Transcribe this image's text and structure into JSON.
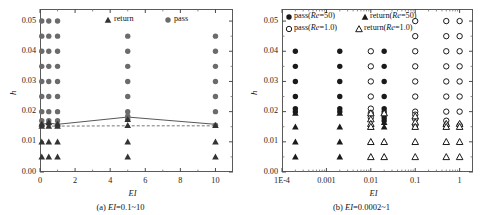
{
  "figure": {
    "panels": [
      {
        "id": "a",
        "caption_prefix": "(a) ",
        "caption_var": "EI",
        "caption_rest": "=0.1~10",
        "caption_full": "(a) EI=0.1~10",
        "xlabel": "EI",
        "ylabel": "h",
        "legend": [
          {
            "label": "return",
            "marker": "filled-triangle"
          },
          {
            "label": "pass",
            "marker": "filled-circle"
          }
        ]
      },
      {
        "id": "b",
        "caption_prefix": "(b) ",
        "caption_var": "EI",
        "caption_rest": "=0.0002~1",
        "caption_full": "(b) EI=0.0002~1",
        "xlabel": "EI",
        "ylabel": "h",
        "legend": [
          {
            "label_pre": "pass(",
            "label_var": "Re",
            "label_post": "=50)",
            "marker": "filled-circle"
          },
          {
            "label_pre": "return(",
            "label_var": "Re",
            "label_post": "=50)",
            "marker": "filled-triangle"
          },
          {
            "label_pre": "pass(",
            "label_var": "Re",
            "label_post": "=1.0)",
            "marker": "open-circle"
          },
          {
            "label_pre": "return(",
            "label_var": "Re",
            "label_post": "=1.0)",
            "marker": "open-triangle"
          }
        ]
      }
    ]
  },
  "chart_data": [
    {
      "type": "scatter",
      "panel": "a",
      "title": "(a) EI=0.1~10",
      "xlabel": "EI",
      "ylabel": "h",
      "xscale": "linear",
      "xlim": [
        0,
        11
      ],
      "ylim": [
        0.0,
        0.054
      ],
      "xticks": [
        "0",
        "2",
        "4",
        "6",
        "8",
        "10"
      ],
      "xtick_values": [
        0,
        2,
        4,
        6,
        8,
        10
      ],
      "yticks": [
        "0.00",
        "0.01",
        "0.02",
        "0.03",
        "0.04",
        "0.05"
      ],
      "ytick_values": [
        0.0,
        0.01,
        0.02,
        0.03,
        0.04,
        0.05
      ],
      "minor_ticks": true,
      "grid": false,
      "legend_position": "top-center",
      "series": [
        {
          "name": "pass",
          "marker": "filled-circle",
          "color": "#6b6b6b",
          "points": [
            {
              "x": 0.1,
              "y": 0.05
            },
            {
              "x": 0.5,
              "y": 0.05
            },
            {
              "x": 1.0,
              "y": 0.05
            },
            {
              "x": 0.1,
              "y": 0.045
            },
            {
              "x": 0.5,
              "y": 0.045
            },
            {
              "x": 1.0,
              "y": 0.045
            },
            {
              "x": 0.1,
              "y": 0.04
            },
            {
              "x": 0.5,
              "y": 0.04
            },
            {
              "x": 1.0,
              "y": 0.04
            },
            {
              "x": 0.1,
              "y": 0.035
            },
            {
              "x": 0.5,
              "y": 0.035
            },
            {
              "x": 1.0,
              "y": 0.035
            },
            {
              "x": 0.1,
              "y": 0.03
            },
            {
              "x": 0.5,
              "y": 0.03
            },
            {
              "x": 1.0,
              "y": 0.03
            },
            {
              "x": 0.1,
              "y": 0.025
            },
            {
              "x": 0.5,
              "y": 0.025
            },
            {
              "x": 1.0,
              "y": 0.025
            },
            {
              "x": 0.1,
              "y": 0.02
            },
            {
              "x": 0.5,
              "y": 0.02
            },
            {
              "x": 1.0,
              "y": 0.02
            },
            {
              "x": 0.1,
              "y": 0.017
            },
            {
              "x": 0.5,
              "y": 0.017
            },
            {
              "x": 1.0,
              "y": 0.017
            },
            {
              "x": 0.1,
              "y": 0.0155
            },
            {
              "x": 0.5,
              "y": 0.016
            },
            {
              "x": 1.0,
              "y": 0.0155
            },
            {
              "x": 5.0,
              "y": 0.045
            },
            {
              "x": 5.0,
              "y": 0.04
            },
            {
              "x": 5.0,
              "y": 0.035
            },
            {
              "x": 5.0,
              "y": 0.03
            },
            {
              "x": 5.0,
              "y": 0.025
            },
            {
              "x": 5.0,
              "y": 0.02
            },
            {
              "x": 5.0,
              "y": 0.0185
            },
            {
              "x": 5.0,
              "y": 0.0175
            },
            {
              "x": 10.0,
              "y": 0.045
            },
            {
              "x": 10.0,
              "y": 0.04
            },
            {
              "x": 10.0,
              "y": 0.035
            },
            {
              "x": 10.0,
              "y": 0.03
            },
            {
              "x": 10.0,
              "y": 0.025
            },
            {
              "x": 10.0,
              "y": 0.02
            },
            {
              "x": 10.0,
              "y": 0.0155
            }
          ]
        },
        {
          "name": "return",
          "marker": "filled-triangle",
          "color": "#333333",
          "points": [
            {
              "x": 0.1,
              "y": 0.016
            },
            {
              "x": 0.5,
              "y": 0.0165
            },
            {
              "x": 1.0,
              "y": 0.016
            },
            {
              "x": 0.1,
              "y": 0.0152
            },
            {
              "x": 0.5,
              "y": 0.0152
            },
            {
              "x": 1.0,
              "y": 0.0152
            },
            {
              "x": 0.1,
              "y": 0.01
            },
            {
              "x": 0.5,
              "y": 0.01
            },
            {
              "x": 1.0,
              "y": 0.01
            },
            {
              "x": 0.1,
              "y": 0.005
            },
            {
              "x": 0.5,
              "y": 0.005
            },
            {
              "x": 1.0,
              "y": 0.005
            },
            {
              "x": 5.0,
              "y": 0.0175
            },
            {
              "x": 5.0,
              "y": 0.0155
            },
            {
              "x": 5.0,
              "y": 0.01
            },
            {
              "x": 5.0,
              "y": 0.005
            },
            {
              "x": 10.0,
              "y": 0.0155
            },
            {
              "x": 10.0,
              "y": 0.01
            },
            {
              "x": 10.0,
              "y": 0.005
            }
          ]
        }
      ],
      "lines": [
        {
          "name": "solid-boundary",
          "style": "solid",
          "color": "#444444",
          "points": [
            {
              "x": 0.1,
              "y": 0.0158
            },
            {
              "x": 0.5,
              "y": 0.0162
            },
            {
              "x": 1.0,
              "y": 0.0158
            },
            {
              "x": 5.0,
              "y": 0.0182
            },
            {
              "x": 10.0,
              "y": 0.0158
            }
          ]
        },
        {
          "name": "dashed-boundary",
          "style": "dashed",
          "color": "#666666",
          "points": [
            {
              "x": 0.1,
              "y": 0.0152
            },
            {
              "x": 1.0,
              "y": 0.0152
            },
            {
              "x": 5.0,
              "y": 0.0153
            },
            {
              "x": 10.0,
              "y": 0.0153
            }
          ]
        }
      ]
    },
    {
      "type": "scatter",
      "panel": "b",
      "title": "(b) EI=0.0002~1",
      "xlabel": "EI",
      "ylabel": "h",
      "xscale": "log",
      "xlim": [
        0.0001,
        2.0
      ],
      "ylim": [
        0.0,
        0.054
      ],
      "xticks": [
        "1E-4",
        "0.001",
        "0.01",
        "0.1",
        "1"
      ],
      "xtick_values": [
        0.0001,
        0.001,
        0.01,
        0.1,
        1
      ],
      "yticks": [
        "0.00",
        "0.01",
        "0.02",
        "0.03",
        "0.04",
        "0.05"
      ],
      "ytick_values": [
        0.0,
        0.01,
        0.02,
        0.03,
        0.04,
        0.05
      ],
      "minor_ticks": true,
      "grid": false,
      "legend_position": "top-left",
      "series": [
        {
          "name": "pass(Re=50)",
          "marker": "filled-circle",
          "color": "#1a1a1a",
          "points": [
            {
              "x": 0.0002,
              "y": 0.04
            },
            {
              "x": 0.0002,
              "y": 0.035
            },
            {
              "x": 0.0002,
              "y": 0.03
            },
            {
              "x": 0.0002,
              "y": 0.025
            },
            {
              "x": 0.0002,
              "y": 0.021
            },
            {
              "x": 0.0002,
              "y": 0.02
            },
            {
              "x": 0.002,
              "y": 0.04
            },
            {
              "x": 0.002,
              "y": 0.035
            },
            {
              "x": 0.002,
              "y": 0.03
            },
            {
              "x": 0.002,
              "y": 0.025
            },
            {
              "x": 0.002,
              "y": 0.021
            },
            {
              "x": 0.002,
              "y": 0.02
            },
            {
              "x": 0.02,
              "y": 0.04
            },
            {
              "x": 0.02,
              "y": 0.035
            },
            {
              "x": 0.02,
              "y": 0.03
            },
            {
              "x": 0.02,
              "y": 0.025
            },
            {
              "x": 0.02,
              "y": 0.021
            },
            {
              "x": 0.02,
              "y": 0.02
            },
            {
              "x": 0.02,
              "y": 0.019
            },
            {
              "x": 0.02,
              "y": 0.018
            },
            {
              "x": 0.02,
              "y": 0.017
            }
          ]
        },
        {
          "name": "return(Re=50)",
          "marker": "filled-triangle",
          "color": "#1a1a1a",
          "points": [
            {
              "x": 0.0002,
              "y": 0.0195
            },
            {
              "x": 0.0002,
              "y": 0.015
            },
            {
              "x": 0.0002,
              "y": 0.01
            },
            {
              "x": 0.0002,
              "y": 0.005
            },
            {
              "x": 0.002,
              "y": 0.0195
            },
            {
              "x": 0.002,
              "y": 0.015
            },
            {
              "x": 0.002,
              "y": 0.01
            },
            {
              "x": 0.002,
              "y": 0.005
            },
            {
              "x": 0.02,
              "y": 0.0165
            },
            {
              "x": 0.02,
              "y": 0.015
            },
            {
              "x": 0.02,
              "y": 0.01
            },
            {
              "x": 0.02,
              "y": 0.005
            },
            {
              "x": 0.01,
              "y": 0.015
            },
            {
              "x": 0.01,
              "y": 0.01
            },
            {
              "x": 0.01,
              "y": 0.005
            }
          ]
        },
        {
          "name": "pass(Re=1.0)",
          "marker": "open-circle",
          "color": "#1a1a1a",
          "points": [
            {
              "x": 0.01,
              "y": 0.04
            },
            {
              "x": 0.01,
              "y": 0.035
            },
            {
              "x": 0.01,
              "y": 0.03
            },
            {
              "x": 0.01,
              "y": 0.025
            },
            {
              "x": 0.01,
              "y": 0.021
            },
            {
              "x": 0.01,
              "y": 0.0195
            },
            {
              "x": 0.01,
              "y": 0.018
            },
            {
              "x": 0.1,
              "y": 0.05
            },
            {
              "x": 0.1,
              "y": 0.045
            },
            {
              "x": 0.1,
              "y": 0.04
            },
            {
              "x": 0.1,
              "y": 0.035
            },
            {
              "x": 0.1,
              "y": 0.03
            },
            {
              "x": 0.1,
              "y": 0.025
            },
            {
              "x": 0.1,
              "y": 0.02
            },
            {
              "x": 0.1,
              "y": 0.019
            },
            {
              "x": 0.1,
              "y": 0.0175
            },
            {
              "x": 0.1,
              "y": 0.0155
            },
            {
              "x": 0.5,
              "y": 0.05
            },
            {
              "x": 0.5,
              "y": 0.045
            },
            {
              "x": 0.5,
              "y": 0.04
            },
            {
              "x": 0.5,
              "y": 0.035
            },
            {
              "x": 0.5,
              "y": 0.03
            },
            {
              "x": 0.5,
              "y": 0.025
            },
            {
              "x": 0.5,
              "y": 0.02
            },
            {
              "x": 0.5,
              "y": 0.017
            },
            {
              "x": 0.5,
              "y": 0.0155
            },
            {
              "x": 1.0,
              "y": 0.05
            },
            {
              "x": 1.0,
              "y": 0.045
            },
            {
              "x": 1.0,
              "y": 0.04
            },
            {
              "x": 1.0,
              "y": 0.035
            },
            {
              "x": 1.0,
              "y": 0.03
            },
            {
              "x": 1.0,
              "y": 0.025
            },
            {
              "x": 1.0,
              "y": 0.02
            },
            {
              "x": 1.0,
              "y": 0.0155
            }
          ]
        },
        {
          "name": "return(Re=1.0)",
          "marker": "open-triangle",
          "color": "#1a1a1a",
          "points": [
            {
              "x": 0.01,
              "y": 0.0195
            },
            {
              "x": 0.01,
              "y": 0.0175
            },
            {
              "x": 0.01,
              "y": 0.016
            },
            {
              "x": 0.01,
              "y": 0.015
            },
            {
              "x": 0.01,
              "y": 0.01
            },
            {
              "x": 0.01,
              "y": 0.005
            },
            {
              "x": 0.02,
              "y": 0.0195
            },
            {
              "x": 0.02,
              "y": 0.01
            },
            {
              "x": 0.02,
              "y": 0.005
            },
            {
              "x": 0.1,
              "y": 0.0185
            },
            {
              "x": 0.1,
              "y": 0.0165
            },
            {
              "x": 0.1,
              "y": 0.015
            },
            {
              "x": 0.1,
              "y": 0.01
            },
            {
              "x": 0.1,
              "y": 0.005
            },
            {
              "x": 0.5,
              "y": 0.016
            },
            {
              "x": 0.5,
              "y": 0.015
            },
            {
              "x": 0.5,
              "y": 0.01
            },
            {
              "x": 0.5,
              "y": 0.005
            },
            {
              "x": 1.0,
              "y": 0.016
            },
            {
              "x": 1.0,
              "y": 0.015
            },
            {
              "x": 1.0,
              "y": 0.01
            },
            {
              "x": 1.0,
              "y": 0.005
            }
          ]
        }
      ],
      "lines": []
    }
  ]
}
